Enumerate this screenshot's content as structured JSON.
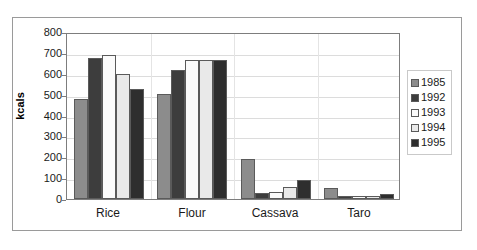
{
  "chart_data": {
    "type": "bar",
    "title": "",
    "subtitle": "",
    "xlabel": "",
    "ylabel": "kcals",
    "ylim": [
      0,
      800
    ],
    "ytick_step": 100,
    "yticks": [
      "800",
      "700",
      "600",
      "500",
      "400",
      "300",
      "200",
      "100",
      "0"
    ],
    "grid": true,
    "legend_position": "right",
    "categories": [
      "Rice",
      "Flour",
      "Cassava",
      "Taro"
    ],
    "series": [
      {
        "name": "1985",
        "color": "#8c8c8c",
        "values": [
          480,
          502,
          192,
          52
        ]
      },
      {
        "name": "1992",
        "color": "#3d3d3d",
        "values": [
          675,
          620,
          30,
          12
        ]
      },
      {
        "name": "1993",
        "color": "#fbfbfb",
        "values": [
          688,
          668,
          33,
          12
        ]
      },
      {
        "name": "1994",
        "color": "#e9e9e9",
        "values": [
          598,
          665,
          57,
          15
        ]
      },
      {
        "name": "1995",
        "color": "#2e2e2e",
        "values": [
          527,
          668,
          93,
          25
        ]
      }
    ]
  },
  "axis": {
    "y_title": "kcals"
  },
  "legend": {
    "entries": [
      "1985",
      "1992",
      "1993",
      "1994",
      "1995"
    ]
  }
}
